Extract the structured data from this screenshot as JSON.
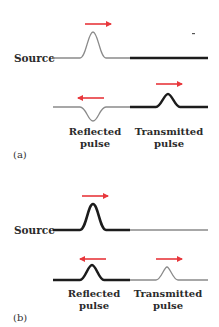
{
  "colors": {
    "arrow": "#e8373c",
    "light_string": "#8a8a8a",
    "heavy_string": "#1c1c1c",
    "text": "#2b2b2b"
  },
  "panels": [
    {
      "id": "a",
      "label": "(a)",
      "source_label": "Source",
      "description": "Pulse travels from a light string into a heavy string; reflected pulse is inverted.",
      "incident": {
        "string_left": "light",
        "string_right": "heavy",
        "pulse_direction": "right"
      },
      "result": {
        "reflected": {
          "label_line1": "Reflected",
          "label_line2": "pulse",
          "direction": "left",
          "inverted": true,
          "on_string": "light"
        },
        "transmitted": {
          "label_line1": "Transmitted",
          "label_line2": "pulse",
          "direction": "right",
          "inverted": false,
          "on_string": "heavy"
        }
      }
    },
    {
      "id": "b",
      "label": "(b)",
      "source_label": "Source",
      "description": "Pulse travels from a heavy string into a light string; reflected pulse is upright.",
      "incident": {
        "string_left": "heavy",
        "string_right": "light",
        "pulse_direction": "right"
      },
      "result": {
        "reflected": {
          "label_line1": "Reflected",
          "label_line2": "pulse",
          "direction": "left",
          "inverted": false,
          "on_string": "heavy"
        },
        "transmitted": {
          "label_line1": "Transmitted",
          "label_line2": "pulse",
          "direction": "right",
          "inverted": false,
          "on_string": "light"
        }
      }
    }
  ]
}
